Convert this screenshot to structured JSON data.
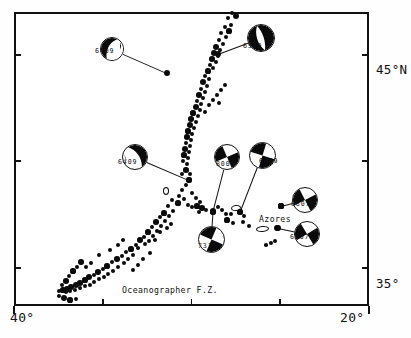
{
  "figure": {
    "kind": "seismicity-focal-mechanism-map",
    "region": "Azores - Mid-Atlantic Ridge"
  },
  "axes": {
    "left_label_top": "45°N",
    "left_label_bottom": "35°",
    "bottom_left_label": "40°",
    "bottom_right_label": "20°",
    "lon_range": [
      -40,
      -20
    ],
    "lat_range": [
      33.2,
      47.0
    ],
    "lat_ticks": [
      45,
      40,
      35
    ],
    "lon_ticks": [
      40,
      35,
      30,
      25,
      20
    ]
  },
  "geo_labels": [
    {
      "text": "Azores",
      "x": 259,
      "y": 214
    },
    {
      "text": "Oceanographer F.Z.",
      "x": 122,
      "y": 285
    }
  ],
  "mechanisms": [
    {
      "id": "m1",
      "label": "6409",
      "label_x": 95,
      "label_y": 47,
      "ball_x": 112,
      "ball_y": 49,
      "ball_d": 24,
      "epi_x": 167,
      "epi_y": 73,
      "epi_r": 3.2,
      "type": "two-lobe",
      "rotation": 28,
      "fill": "lower-left-lobe"
    },
    {
      "id": "m2",
      "label": "6509",
      "label_x": 243,
      "label_y": 42,
      "ball_x": 261,
      "ball_y": 38,
      "ball_d": 28,
      "epi_x": 218,
      "epi_y": 54,
      "epi_r": 3.0,
      "type": "two-lobe",
      "rotation": -18,
      "fill": "mostly-black"
    },
    {
      "id": "m3",
      "label": "6409",
      "label_x": 118,
      "label_y": 158,
      "ball_x": 135,
      "ball_y": 157,
      "ball_d": 26,
      "epi_x": 189,
      "epi_y": 180,
      "epi_r": 3.2,
      "type": "two-lobe",
      "rotation": -35,
      "fill": "right-lobe"
    },
    {
      "id": "m4",
      "label": "8001",
      "label_x": 216,
      "label_y": 160,
      "ball_x": 227,
      "ball_y": 157,
      "ball_d": 26,
      "epi_x": 213,
      "epi_y": 211,
      "epi_r": 3.2,
      "type": "quadrant",
      "rotation": 22,
      "fill": "ne-sw"
    },
    {
      "id": "m5",
      "label": "6409",
      "label_x": 259,
      "label_y": 157,
      "ball_x": 262,
      "ball_y": 155,
      "ball_d": 27,
      "epi_x": 240,
      "epi_y": 212,
      "epi_r": 3.2,
      "type": "quadrant",
      "rotation": -28,
      "fill": "nw-se"
    },
    {
      "id": "m6",
      "label": "7311",
      "label_x": 198,
      "label_y": 242,
      "ball_x": 211,
      "ball_y": 239,
      "ball_d": 27,
      "epi_x": 213,
      "epi_y": 212,
      "epi_r": 3.0,
      "type": "quadrant",
      "rotation": -22,
      "fill": "nw-se"
    },
    {
      "id": "m7",
      "label": "6607",
      "label_x": 291,
      "label_y": 200,
      "ball_x": 305,
      "ball_y": 200,
      "ball_d": 26,
      "epi_x": 281,
      "epi_y": 206,
      "epi_r": 2.6,
      "type": "quadrant",
      "rotation": 18,
      "fill": "ne-sw"
    },
    {
      "id": "m8",
      "label": "6607",
      "label_x": 290,
      "label_y": 233,
      "ball_x": 307,
      "ball_y": 234,
      "ball_d": 26,
      "epi_x": 278,
      "epi_y": 228,
      "epi_r": 3.2,
      "type": "quadrant",
      "rotation": 14,
      "fill": "ne-sw"
    }
  ],
  "islands": [
    {
      "x": 165,
      "y": 190,
      "w": 4.5,
      "h": 6.0,
      "rot": 0
    },
    {
      "x": 235,
      "y": 207,
      "w": 8.0,
      "h": 4.0,
      "rot": -8
    },
    {
      "x": 261,
      "y": 228,
      "w": 11.0,
      "h": 4.0,
      "rot": -6
    }
  ],
  "epicenters": [
    [
      232,
      13,
      2.2
    ],
    [
      236,
      16,
      3.0
    ],
    [
      228,
      18,
      2.0
    ],
    [
      231,
      25,
      2.2
    ],
    [
      225,
      27,
      2.0
    ],
    [
      229,
      31,
      2.6
    ],
    [
      221,
      33,
      2.2
    ],
    [
      226,
      37,
      2.0
    ],
    [
      219,
      40,
      2.4
    ],
    [
      223,
      44,
      2.2
    ],
    [
      216,
      47,
      3.4
    ],
    [
      220,
      50,
      2.4
    ],
    [
      214,
      53,
      3.0
    ],
    [
      218,
      56,
      2.2
    ],
    [
      212,
      59,
      2.8
    ],
    [
      216,
      62,
      2.0
    ],
    [
      210,
      65,
      2.4
    ],
    [
      213,
      68,
      2.0
    ],
    [
      208,
      71,
      2.6
    ],
    [
      205,
      76,
      2.2
    ],
    [
      209,
      79,
      2.0
    ],
    [
      203,
      82,
      3.0
    ],
    [
      207,
      86,
      2.2
    ],
    [
      201,
      89,
      2.4
    ],
    [
      205,
      92,
      2.0
    ],
    [
      199,
      95,
      2.8
    ],
    [
      203,
      98,
      2.2
    ],
    [
      197,
      101,
      2.4
    ],
    [
      201,
      104,
      2.0
    ],
    [
      196,
      107,
      3.2
    ],
    [
      200,
      110,
      2.2
    ],
    [
      193,
      113,
      2.6
    ],
    [
      198,
      116,
      2.2
    ],
    [
      191,
      119,
      2.8
    ],
    [
      196,
      122,
      2.4
    ],
    [
      190,
      125,
      3.0
    ],
    [
      194,
      128,
      2.2
    ],
    [
      188,
      131,
      2.6
    ],
    [
      192,
      134,
      2.0
    ],
    [
      187,
      137,
      2.8
    ],
    [
      191,
      140,
      2.2
    ],
    [
      186,
      143,
      2.4
    ],
    [
      190,
      146,
      2.0
    ],
    [
      185,
      149,
      3.0
    ],
    [
      189,
      152,
      2.2
    ],
    [
      184,
      155,
      2.6
    ],
    [
      188,
      158,
      2.2
    ],
    [
      183,
      161,
      2.4
    ],
    [
      187,
      164,
      2.0
    ],
    [
      186,
      170,
      2.8
    ],
    [
      190,
      174,
      2.4
    ],
    [
      189,
      180,
      3.2
    ],
    [
      186,
      185,
      2.2
    ],
    [
      182,
      190,
      2.0
    ],
    [
      179,
      196,
      2.4
    ],
    [
      184,
      199,
      2.2
    ],
    [
      178,
      203,
      2.6
    ],
    [
      188,
      205,
      2.2
    ],
    [
      192,
      207,
      2.4
    ],
    [
      197,
      206,
      2.6
    ],
    [
      202,
      208,
      2.8
    ],
    [
      206,
      210,
      2.2
    ],
    [
      199,
      212,
      2.4
    ],
    [
      213,
      212,
      3.0
    ],
    [
      218,
      207,
      2.4
    ],
    [
      222,
      210,
      2.2
    ],
    [
      226,
      214,
      2.4
    ],
    [
      231,
      214,
      2.2
    ],
    [
      227,
      220,
      2.6
    ],
    [
      233,
      223,
      2.0
    ],
    [
      240,
      212,
      2.8
    ],
    [
      244,
      216,
      2.2
    ],
    [
      243,
      222,
      2.4
    ],
    [
      249,
      226,
      2.0
    ],
    [
      277,
      228,
      3.0
    ],
    [
      271,
      243,
      2.0
    ],
    [
      266,
      245,
      1.8
    ],
    [
      275,
      241,
      2.4
    ],
    [
      281,
      206,
      2.6
    ],
    [
      172,
      200,
      2.2
    ],
    [
      168,
      206,
      2.4
    ],
    [
      173,
      211,
      2.2
    ],
    [
      164,
      213,
      2.6
    ],
    [
      169,
      216,
      2.2
    ],
    [
      160,
      217,
      2.4
    ],
    [
      165,
      221,
      2.0
    ],
    [
      156,
      222,
      2.8
    ],
    [
      161,
      226,
      2.2
    ],
    [
      152,
      227,
      2.4
    ],
    [
      157,
      231,
      2.0
    ],
    [
      148,
      232,
      2.6
    ],
    [
      153,
      236,
      2.2
    ],
    [
      144,
      237,
      2.4
    ],
    [
      149,
      241,
      2.0
    ],
    [
      140,
      240,
      2.8
    ],
    [
      145,
      244,
      2.2
    ],
    [
      136,
      245,
      2.4
    ],
    [
      131,
      249,
      2.6
    ],
    [
      126,
      252,
      2.2
    ],
    [
      138,
      248,
      2.0
    ],
    [
      122,
      256,
      2.4
    ],
    [
      133,
      255,
      2.2
    ],
    [
      117,
      259,
      2.8
    ],
    [
      128,
      259,
      2.0
    ],
    [
      112,
      262,
      2.4
    ],
    [
      124,
      263,
      2.2
    ],
    [
      107,
      266,
      2.6
    ],
    [
      118,
      267,
      2.0
    ],
    [
      103,
      269,
      2.4
    ],
    [
      113,
      271,
      2.2
    ],
    [
      98,
      272,
      2.8
    ],
    [
      108,
      274,
      2.0
    ],
    [
      94,
      275,
      2.4
    ],
    [
      104,
      277,
      2.2
    ],
    [
      89,
      277,
      3.0
    ],
    [
      99,
      279,
      2.2
    ],
    [
      85,
      280,
      2.6
    ],
    [
      94,
      282,
      2.4
    ],
    [
      80,
      283,
      2.8
    ],
    [
      90,
      285,
      2.2
    ],
    [
      76,
      285,
      3.0
    ],
    [
      85,
      286,
      2.4
    ],
    [
      71,
      287,
      2.8
    ],
    [
      80,
      288,
      2.2
    ],
    [
      67,
      289,
      3.0
    ],
    [
      75,
      290,
      2.4
    ],
    [
      63,
      290,
      2.6
    ],
    [
      70,
      291,
      2.2
    ],
    [
      59,
      291,
      2.4
    ],
    [
      66,
      292,
      2.0
    ],
    [
      81,
      262,
      2.8
    ],
    [
      77,
      267,
      2.4
    ],
    [
      73,
      271,
      2.6
    ],
    [
      69,
      276,
      2.4
    ],
    [
      66,
      281,
      2.8
    ],
    [
      62,
      285,
      2.4
    ],
    [
      86,
      267,
      2.2
    ],
    [
      91,
      263,
      2.0
    ],
    [
      64,
      298,
      3.0
    ],
    [
      70,
      300,
      2.6
    ],
    [
      76,
      299,
      2.4
    ],
    [
      59,
      296,
      2.4
    ],
    [
      143,
      259,
      2.2
    ],
    [
      150,
      253,
      2.0
    ],
    [
      138,
      265,
      2.4
    ],
    [
      133,
      270,
      2.0
    ],
    [
      118,
      245,
      2.2
    ],
    [
      123,
      240,
      2.0
    ],
    [
      110,
      250,
      2.2
    ],
    [
      99,
      255,
      2.0
    ],
    [
      160,
      232,
      2.4
    ],
    [
      155,
      240,
      2.2
    ],
    [
      167,
      228,
      2.0
    ],
    [
      171,
      224,
      2.2
    ],
    [
      196,
      198,
      2.2
    ],
    [
      192,
      193,
      2.0
    ],
    [
      200,
      202,
      2.2
    ],
    [
      182,
      174,
      2.4
    ],
    [
      213,
      100,
      2.2
    ],
    [
      217,
      95,
      2.0
    ],
    [
      209,
      105,
      2.2
    ],
    [
      205,
      112,
      2.0
    ],
    [
      221,
      90,
      2.2
    ],
    [
      225,
      85,
      2.0
    ],
    [
      219,
      103,
      2.2
    ]
  ]
}
